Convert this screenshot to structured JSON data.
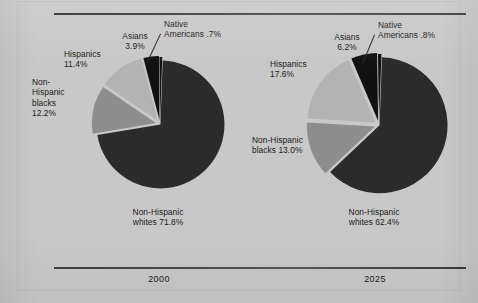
{
  "figure": {
    "background_color": "#c8c8c8",
    "rule_color": "#3a3a3a"
  },
  "palette": {
    "non_hispanic_whites": "#2b2b2b",
    "non_hispanic_blacks": "#8d8d8d",
    "hispanics": "#b3b3b3",
    "asians": "#111111",
    "native_americans": "#111111",
    "gap": "#c8c8c8"
  },
  "chart_data": {
    "type": "pie",
    "title": "",
    "charts": [
      {
        "name": "2000",
        "year_label": "2000",
        "categories": [
          "Non-Hispanic whites",
          "Non-Hispanic blacks",
          "Hispanics",
          "Asians",
          "Native Americans"
        ],
        "values": [
          71.8,
          12.2,
          11.4,
          3.9,
          0.7
        ],
        "labels": [
          {
            "name": "Non-Hispanic whites",
            "text": "Non-Hispanic\nwhites  71.8%",
            "value": 71.8,
            "color": "#2b2b2b"
          },
          {
            "name": "Non-Hispanic blacks",
            "text": "Non-\nHispanic\nblacks\n12.2%",
            "value": 12.2,
            "color": "#8d8d8d"
          },
          {
            "name": "Hispanics",
            "text": "Hispanics\n11.4%",
            "value": 11.4,
            "color": "#b3b3b3"
          },
          {
            "name": "Asians",
            "text": "Asians\n3.9%",
            "value": 3.9,
            "color": "#111111"
          },
          {
            "name": "Native Americans",
            "text": "Native\nAmericans  .7%",
            "value": 0.7,
            "color": "#111111"
          }
        ]
      },
      {
        "name": "2025",
        "year_label": "2025",
        "categories": [
          "Non-Hispanic whites",
          "Non-Hispanic blacks",
          "Hispanics",
          "Asians",
          "Native Americans"
        ],
        "values": [
          62.4,
          13.0,
          17.6,
          6.2,
          0.8
        ],
        "labels": [
          {
            "name": "Non-Hispanic whites",
            "text": "Non-Hispanic\nwhites  62.4%",
            "value": 62.4,
            "color": "#2b2b2b"
          },
          {
            "name": "Non-Hispanic blacks",
            "text": "Non-Hispanic\nblacks  13.0%",
            "value": 13.0,
            "color": "#8d8d8d"
          },
          {
            "name": "Hispanics",
            "text": "Hispanics\n17.6%",
            "value": 17.6,
            "color": "#b3b3b3"
          },
          {
            "name": "Asians",
            "text": "Asians\n6.2%",
            "value": 6.2,
            "color": "#111111"
          },
          {
            "name": "Native Americans",
            "text": "Native\nAmericans  .8%",
            "value": 0.8,
            "color": "#111111"
          }
        ]
      }
    ],
    "legend_position": "callout-labels",
    "grid": false
  },
  "left_chart": {
    "year": "2000",
    "label_whites": "Non-Hispanic\nwhites  71.8%",
    "label_blacks": "Non-\nHispanic\nblacks\n12.2%",
    "label_hispanics": "Hispanics\n11.4%",
    "label_asians": "Asians\n3.9%",
    "label_natives": "Native\nAmericans  .7%"
  },
  "right_chart": {
    "year": "2025",
    "label_whites": "Non-Hispanic\nwhites  62.4%",
    "label_blacks": "Non-Hispanic\nblacks  13.0%",
    "label_hispanics": "Hispanics\n17.6%",
    "label_asians": "Asians\n6.2%",
    "label_natives": "Native\nAmericans  .8%"
  }
}
